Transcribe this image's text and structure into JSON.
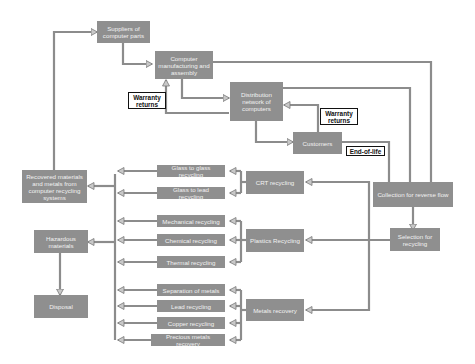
{
  "diagram": {
    "colors": {
      "node_fill": "#8f8f8f",
      "node_text": "#f2f2f2",
      "arrow": "#8c8c8c",
      "tag_border": "#111111"
    },
    "nodes": {
      "suppliers": "Suppliers of\ncomputer parts",
      "manufacturers": "Computer\nmanufacturing and\nassembly",
      "distribution": "Distribution\nnetwork of\ncomputers",
      "customers": "Customers",
      "collection": "Collection for reverse flow",
      "selection": "Selection for\nrecycling",
      "crt": "CRT recycling",
      "plastics": "Plastics Recycling",
      "metals": "Metals recovery",
      "glass_to_glass": "Glass to glass recycling",
      "glass_to_lead": "Glass to lead recycling",
      "mechanical": "Mechanical recycling",
      "chemical": "Chemical recycling",
      "thermal": "Thermal recycling",
      "separation": "Separation of metals",
      "lead": "Lead recycling",
      "copper": "Copper recycling",
      "precious": "Precious metals recovery",
      "recovered": "Recovered materials\nand metals from\ncomputer recycling\nsystems",
      "hazardous": "Hazardous\nmaterials",
      "disposal": "Disposal"
    },
    "tags": {
      "warranty_returns_1": "Warranty\nreturns",
      "warranty_returns_2": "Warranty\nreturns",
      "end_of_life": "End-of-life"
    }
  }
}
